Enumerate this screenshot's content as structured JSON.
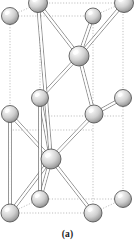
{
  "figure": {
    "caption": "(a)",
    "title": "",
    "type": "crystal-structure-diagram",
    "background_color": "#ffffff",
    "atom_fill_light": "#f2f2f2",
    "atom_fill_mid": "#c9c9c9",
    "atom_fill_dark": "#8f8f8f",
    "atom_outline_color": "#4a4a4a",
    "bond_color": "#6e6e6e",
    "bond_fill_color": "#ffffff",
    "cell_edge_color": "#a0a0a0"
  },
  "chart_data": {
    "type": "scatter",
    "title": "(a)",
    "xlabel": "",
    "ylabel": "",
    "xlim": [
      0,
      135
    ],
    "ylim": [
      0,
      242
    ],
    "grid": true,
    "legend": "none",
    "atoms": [
      {
        "id": "a1",
        "label": "top-left-corner",
        "x": 10,
        "y": 16,
        "r": 8.5
      },
      {
        "id": "a2",
        "label": "top-center-front",
        "x": 38,
        "y": 3,
        "r": 9.5
      },
      {
        "id": "a3",
        "label": "top-inner-right",
        "x": 93,
        "y": 16,
        "r": 8.0
      },
      {
        "id": "a4",
        "label": "top-right-corner",
        "x": 124,
        "y": 3,
        "r": 9.5
      },
      {
        "id": "a5",
        "label": "upper-hub",
        "x": 79,
        "y": 56,
        "r": 10.0
      },
      {
        "id": "a6",
        "label": "mid-left-inner",
        "x": 40,
        "y": 98,
        "r": 8.5
      },
      {
        "id": "a7",
        "label": "mid-right-outer",
        "x": 123,
        "y": 98,
        "r": 8.5
      },
      {
        "id": "a8",
        "label": "mid-left-edge",
        "x": 10,
        "y": 114,
        "r": 8.5
      },
      {
        "id": "a9",
        "label": "mid-center-right",
        "x": 94,
        "y": 114,
        "r": 9.0
      },
      {
        "id": "a10",
        "label": "lower-hub",
        "x": 51,
        "y": 159,
        "r": 10.0
      },
      {
        "id": "a11",
        "label": "bottom-inner-left",
        "x": 40,
        "y": 199,
        "r": 8.5
      },
      {
        "id": "a12",
        "label": "bottom-right-edge",
        "x": 123,
        "y": 199,
        "r": 8.5
      },
      {
        "id": "a13",
        "label": "bottom-left-corner",
        "x": 10,
        "y": 213,
        "r": 9.0
      },
      {
        "id": "a14",
        "label": "bottom-center-corner",
        "x": 93,
        "y": 213,
        "r": 9.0
      }
    ],
    "bonds": [
      {
        "from": "a5",
        "to": "a2"
      },
      {
        "from": "a5",
        "to": "a3"
      },
      {
        "from": "a5",
        "to": "a4"
      },
      {
        "from": "a5",
        "to": "a6"
      },
      {
        "from": "a5",
        "to": "a9"
      },
      {
        "from": "a9",
        "to": "a7"
      },
      {
        "from": "a9",
        "to": "a10"
      },
      {
        "from": "a10",
        "to": "a6"
      },
      {
        "from": "a10",
        "to": "a2"
      },
      {
        "from": "a10",
        "to": "a8"
      },
      {
        "from": "a10",
        "to": "a11"
      },
      {
        "from": "a10",
        "to": "a13"
      },
      {
        "from": "a10",
        "to": "a14"
      },
      {
        "from": "a8",
        "to": "a13"
      },
      {
        "from": "a11",
        "to": "a6"
      }
    ],
    "cell_box": {
      "front": [
        [
          10,
          213
        ],
        [
          93,
          213
        ],
        [
          93,
          130
        ],
        [
          10,
          130
        ]
      ],
      "back": [
        [
          40,
          199
        ],
        [
          123,
          199
        ],
        [
          123,
          116
        ],
        [
          40,
          116
        ]
      ],
      "vertical_lines": [
        {
          "x": 10,
          "y1": 16,
          "y2": 213
        },
        {
          "x": 40,
          "y1": 3,
          "y2": 199
        },
        {
          "x": 93,
          "y1": 16,
          "y2": 213
        },
        {
          "x": 123,
          "y1": 3,
          "y2": 199
        }
      ],
      "top_face": [
        [
          10,
          16
        ],
        [
          93,
          16
        ],
        [
          123,
          3
        ],
        [
          40,
          3
        ]
      ],
      "bottom_face": [
        [
          10,
          213
        ],
        [
          93,
          213
        ],
        [
          123,
          199
        ],
        [
          40,
          199
        ]
      ]
    }
  }
}
